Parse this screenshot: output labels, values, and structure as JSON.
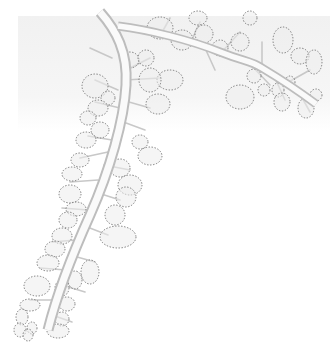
{
  "image": {
    "description": "Grayscale illustration of two tubular branches with side-branches ending in dotted-outline circular and elliptical lobes",
    "colors": {
      "background": "#ffffff",
      "panel": "#f2f2f2",
      "tube_light": "#fafafa",
      "tube_shade": "#bdbdbd",
      "twig": "#c8c8c8",
      "dotted_outline": "#6e6e6e",
      "lobe_fill": "#ececec"
    },
    "branches": [
      {
        "name": "main-descending-branch",
        "path": "M100 12 C116 30 128 52 126 85 C124 120 110 170 90 215 C72 255 58 290 48 330"
      },
      {
        "name": "upper-horizontal-branch",
        "path": "M118 26 C150 30 190 40 220 52 C245 62 250 60 262 68 C282 80 300 92 316 104"
      }
    ],
    "twigs": [
      "M126 70 L150 58",
      "M125 80 L160 78",
      "M122 100 L150 108",
      "M118 120 L145 130",
      "M112 140 L88 136",
      "M108 152 L80 158",
      "M104 165 L130 170",
      "M98 180 L70 182",
      "M95 192 L120 200",
      "M88 210 L62 208",
      "M82 225 L108 235",
      "M76 240 L52 242",
      "M70 255 L95 262",
      "M66 270 L40 268",
      "M62 285 L85 292",
      "M56 300 L30 300",
      "M52 315 L72 322",
      "M112 58 L90 48",
      "M118 90 L95 80",
      "M120 108 L95 102",
      "M160 36 L170 18",
      "M190 44 L200 22",
      "M220 54 L240 32",
      "M262 68 L262 42",
      "M285 84 L310 70",
      "M250 64 L270 85",
      "M275 78 L285 100",
      "M300 94 L310 112",
      "M205 48 L215 70"
    ],
    "lobes": [
      {
        "cx": 160,
        "cy": 28,
        "rx": 13,
        "ry": 11
      },
      {
        "cx": 182,
        "cy": 40,
        "rx": 11,
        "ry": 10
      },
      {
        "cx": 204,
        "cy": 34,
        "rx": 9,
        "ry": 9
      },
      {
        "cx": 220,
        "cy": 48,
        "rx": 8,
        "ry": 8
      },
      {
        "cx": 240,
        "cy": 42,
        "rx": 9,
        "ry": 9
      },
      {
        "cx": 250,
        "cy": 18,
        "rx": 7,
        "ry": 7
      },
      {
        "cx": 283,
        "cy": 40,
        "rx": 10,
        "ry": 13
      },
      {
        "cx": 300,
        "cy": 56,
        "rx": 9,
        "ry": 8
      },
      {
        "cx": 314,
        "cy": 62,
        "rx": 8,
        "ry": 12
      },
      {
        "cx": 170,
        "cy": 80,
        "rx": 13,
        "ry": 10
      },
      {
        "cx": 198,
        "cy": 18,
        "rx": 9,
        "ry": 7
      },
      {
        "cx": 240,
        "cy": 97,
        "rx": 14,
        "ry": 12
      },
      {
        "cx": 254,
        "cy": 76,
        "rx": 7,
        "ry": 7
      },
      {
        "cx": 264,
        "cy": 90,
        "rx": 6,
        "ry": 6
      },
      {
        "cx": 278,
        "cy": 90,
        "rx": 6,
        "ry": 7
      },
      {
        "cx": 290,
        "cy": 82,
        "rx": 5,
        "ry": 6
      },
      {
        "cx": 282,
        "cy": 102,
        "rx": 8,
        "ry": 9
      },
      {
        "cx": 306,
        "cy": 108,
        "rx": 8,
        "ry": 10
      },
      {
        "cx": 316,
        "cy": 95,
        "rx": 6,
        "ry": 6
      },
      {
        "cx": 130,
        "cy": 60,
        "rx": 9,
        "ry": 8
      },
      {
        "cx": 146,
        "cy": 58,
        "rx": 8,
        "ry": 8
      },
      {
        "cx": 150,
        "cy": 80,
        "rx": 11,
        "ry": 12
      },
      {
        "cx": 158,
        "cy": 104,
        "rx": 12,
        "ry": 10
      },
      {
        "cx": 95,
        "cy": 86,
        "rx": 13,
        "ry": 12
      },
      {
        "cx": 108,
        "cy": 98,
        "rx": 7,
        "ry": 7
      },
      {
        "cx": 98,
        "cy": 108,
        "rx": 10,
        "ry": 8
      },
      {
        "cx": 88,
        "cy": 118,
        "rx": 8,
        "ry": 7
      },
      {
        "cx": 100,
        "cy": 130,
        "rx": 9,
        "ry": 8
      },
      {
        "cx": 86,
        "cy": 140,
        "rx": 10,
        "ry": 8
      },
      {
        "cx": 140,
        "cy": 142,
        "rx": 8,
        "ry": 7
      },
      {
        "cx": 150,
        "cy": 156,
        "rx": 12,
        "ry": 9
      },
      {
        "cx": 80,
        "cy": 160,
        "rx": 9,
        "ry": 7
      },
      {
        "cx": 72,
        "cy": 174,
        "rx": 10,
        "ry": 7
      },
      {
        "cx": 120,
        "cy": 168,
        "rx": 10,
        "ry": 9
      },
      {
        "cx": 130,
        "cy": 185,
        "rx": 12,
        "ry": 10
      },
      {
        "cx": 126,
        "cy": 197,
        "rx": 10,
        "ry": 10
      },
      {
        "cx": 70,
        "cy": 194,
        "rx": 11,
        "ry": 9
      },
      {
        "cx": 76,
        "cy": 209,
        "rx": 10,
        "ry": 7
      },
      {
        "cx": 68,
        "cy": 220,
        "rx": 9,
        "ry": 8
      },
      {
        "cx": 115,
        "cy": 215,
        "rx": 10,
        "ry": 10
      },
      {
        "cx": 118,
        "cy": 237,
        "rx": 18,
        "ry": 11
      },
      {
        "cx": 62,
        "cy": 236,
        "rx": 10,
        "ry": 8
      },
      {
        "cx": 55,
        "cy": 249,
        "rx": 10,
        "ry": 8
      },
      {
        "cx": 48,
        "cy": 263,
        "rx": 11,
        "ry": 8
      },
      {
        "cx": 90,
        "cy": 272,
        "rx": 9,
        "ry": 12
      },
      {
        "cx": 75,
        "cy": 280,
        "rx": 7,
        "ry": 9
      },
      {
        "cx": 62,
        "cy": 288,
        "rx": 7,
        "ry": 8
      },
      {
        "cx": 37,
        "cy": 286,
        "rx": 13,
        "ry": 10
      },
      {
        "cx": 30,
        "cy": 305,
        "rx": 10,
        "ry": 6
      },
      {
        "cx": 67,
        "cy": 304,
        "rx": 8,
        "ry": 7
      },
      {
        "cx": 62,
        "cy": 319,
        "rx": 7,
        "ry": 7
      },
      {
        "cx": 22,
        "cy": 317,
        "rx": 6,
        "ry": 8
      },
      {
        "cx": 20,
        "cy": 330,
        "rx": 6,
        "ry": 7
      },
      {
        "cx": 32,
        "cy": 328,
        "rx": 5,
        "ry": 6
      },
      {
        "cx": 58,
        "cy": 331,
        "rx": 11,
        "ry": 7
      },
      {
        "cx": 28,
        "cy": 335,
        "rx": 5,
        "ry": 6
      }
    ]
  }
}
